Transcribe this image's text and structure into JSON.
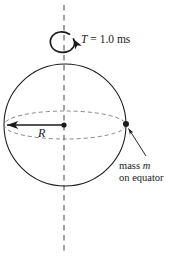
{
  "figure": {
    "colors": {
      "stroke": "#1a1a1a",
      "dashed_axis": "#555555",
      "dashed_equator": "#777777",
      "background": "#ffffff",
      "text": "#1a1a1a"
    },
    "labels": {
      "period_symbol": "T",
      "period_equals": " = ",
      "period_value": "1.0 ms",
      "radius_symbol": "R",
      "mass_prefix": "mass ",
      "mass_symbol": "m",
      "mass_line2": "on equator"
    },
    "icons": {
      "rotation_arrow": "rotation-arrow-icon",
      "axis": "rotation-axis-icon",
      "sphere": "sphere-icon",
      "equator": "equator-ellipse-icon",
      "center_point": "center-point-icon",
      "mass_point": "mass-point-icon",
      "radius_arrow": "radius-arrow-icon",
      "leader_line": "leader-line-icon"
    },
    "geometry": {
      "sphere_center_x": 65,
      "sphere_center_y": 125,
      "sphere_radius": 61,
      "equator_semi_minor": 14,
      "axis_x": 64,
      "axis_top_y": 5,
      "axis_bottom_y": 251,
      "mass_point_x": 126,
      "mass_point_y": 125,
      "center_point_x": 64,
      "center_point_y": 125
    }
  }
}
